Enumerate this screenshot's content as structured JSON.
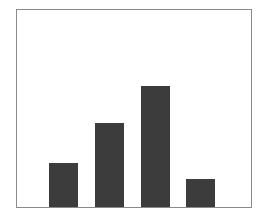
{
  "chart_data": {
    "type": "bar",
    "title": "",
    "xlabel": "",
    "ylabel": "",
    "categories": [
      "1",
      "2",
      "3",
      "4"
    ],
    "values": [
      22,
      42,
      61,
      14
    ],
    "ylim": [
      0,
      100
    ],
    "grid": false,
    "legend": null,
    "bar_color": "#3c3c3c",
    "frame_color": "#8a8a8a",
    "background_color": "#ffffff"
  }
}
